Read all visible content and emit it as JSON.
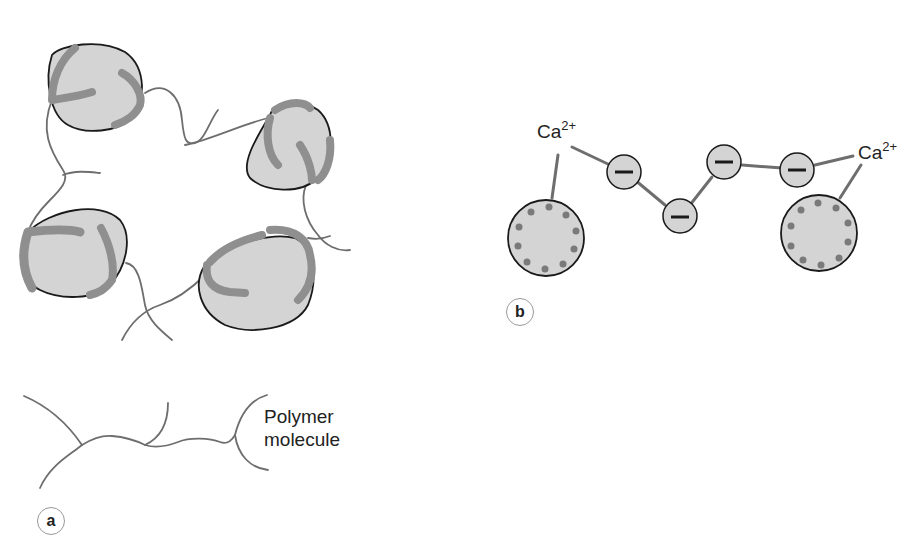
{
  "panel_a": {
    "label": "a",
    "polymer_label_line1": "Polymer",
    "polymer_label_line2": "molecule",
    "particle_count": 4
  },
  "panel_b": {
    "label": "b",
    "ion_left": {
      "symbol": "Ca",
      "charge": "2+"
    },
    "ion_right": {
      "symbol": "Ca",
      "charge": "2+"
    },
    "anionic_groups": [
      "–",
      "–",
      "–",
      "–"
    ],
    "particle_count": 2
  },
  "colors": {
    "particle_fill": "#d4d4d4",
    "particle_outline": "#1a1a1a",
    "adsorbed_polymer": "#8f8f8f",
    "polymer_line": "#6e6e6e",
    "dot": "#7a7a7a"
  }
}
